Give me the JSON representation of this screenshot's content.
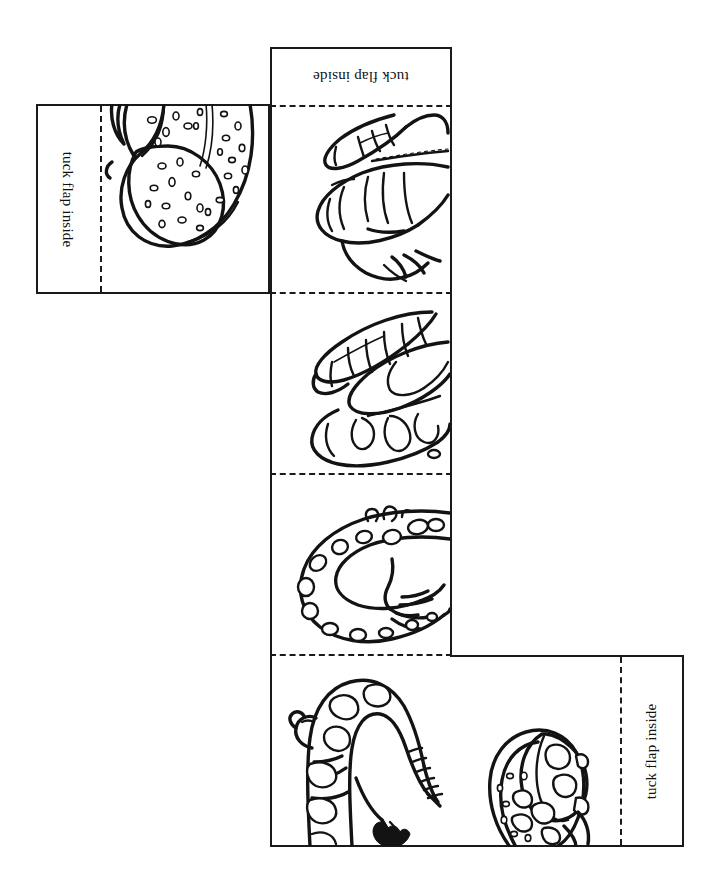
{
  "document": {
    "kind": "printable-craft-template",
    "title": "Salamander paper cube / box net coloring page",
    "page_size_px": {
      "width": 722,
      "height": 878
    },
    "background_color": "#ffffff",
    "ink_color": "#131313"
  },
  "labels": {
    "tuck_flap_inside": "tuck flap inside"
  },
  "flaps": [
    {
      "id": "left-flap",
      "label": "tuck flap inside",
      "text_rotation_deg": 90,
      "rect": {
        "x": 36,
        "y": 104,
        "w": 234,
        "h": 190
      },
      "fold_line": {
        "orientation": "vertical",
        "x": 100
      },
      "artwork": "spotted-salamander-head-closeup"
    },
    {
      "id": "top-flap",
      "label": "tuck flap inside",
      "text_rotation_deg": 180,
      "rect": {
        "x": 270,
        "y": 47,
        "w": 182,
        "h": 60
      },
      "fold_line": {
        "orientation": "horizontal",
        "y": 105
      },
      "artwork": "none"
    },
    {
      "id": "right-flap",
      "label": "tuck flap inside",
      "text_rotation_deg": -90,
      "rect": {
        "x": 450,
        "y": 655,
        "w": 234,
        "h": 192
      },
      "fold_line": {
        "orientation": "vertical",
        "x": 620
      },
      "artwork": "spotted-salamander-head-closeup-2"
    }
  ],
  "main_strip": {
    "rect": {
      "x": 270,
      "y": 105,
      "w": 182,
      "h": 742
    },
    "panel_count": 4,
    "fold_lines_y": [
      105,
      292,
      473,
      654
    ],
    "panels": [
      {
        "index": 1,
        "artwork": "newt-legs-closeup",
        "y": 106,
        "h": 186
      },
      {
        "index": 2,
        "artwork": "newt-toes-closeup",
        "y": 293,
        "h": 180
      },
      {
        "index": 3,
        "artwork": "spotted-salamander-curved",
        "y": 474,
        "h": 180
      },
      {
        "index": 4,
        "artwork": "tiger-salamander-full",
        "y": 655,
        "h": 192
      }
    ]
  },
  "line_styles": {
    "cut_line": "solid",
    "fold_line": "dashed"
  }
}
